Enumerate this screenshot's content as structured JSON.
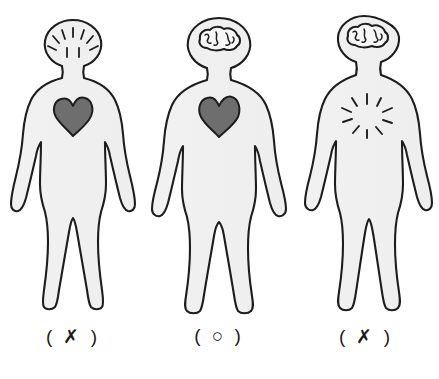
{
  "diagram": {
    "background_color": "#ffffff",
    "body_fill_color": "#f0f0f0",
    "outline_color": "#1d1d1d",
    "heart_fill_color": "#6e6e6e",
    "brain_fill_color": "#f7f7f7",
    "figures": [
      {
        "id": "figure-1",
        "label": "( ✗ )",
        "label_mark": "✗",
        "head_content": "radiating-lines",
        "head_content_name": "empty-head-radiating-lines",
        "chest_content": "heart",
        "chest_content_name": "heart-shape",
        "verdict": "incorrect"
      },
      {
        "id": "figure-2",
        "label": "( ○ )",
        "label_mark": "○",
        "head_content": "brain",
        "head_content_name": "brain-shape",
        "chest_content": "heart",
        "chest_content_name": "heart-shape",
        "verdict": "correct"
      },
      {
        "id": "figure-3",
        "label": "( ✗ )",
        "label_mark": "✗",
        "head_content": "brain",
        "head_content_name": "brain-shape",
        "chest_content": "radiating-lines",
        "chest_content_name": "empty-chest-radiating-lines",
        "verdict": "incorrect"
      }
    ]
  }
}
